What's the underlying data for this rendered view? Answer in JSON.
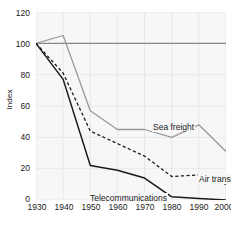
{
  "chart_data": {
    "type": "line",
    "title": "",
    "xlabel": "",
    "ylabel": "Index",
    "xlim": [
      1930,
      2000
    ],
    "ylim": [
      0,
      120
    ],
    "yticks": [
      0,
      20,
      40,
      60,
      80,
      100,
      120
    ],
    "xticks": [
      1930,
      1940,
      1950,
      1960,
      1970,
      1980,
      1990,
      2000
    ],
    "grid": true,
    "legend_position": "inline-annotations",
    "x": [
      1930,
      1940,
      1950,
      1960,
      1970,
      1980,
      1990,
      2000
    ],
    "series": [
      {
        "name": "Sea freight",
        "values": [
          100,
          105,
          57,
          45,
          45,
          40,
          48,
          31
        ],
        "color": "#999999",
        "style": "solid",
        "label": "Sea freight"
      },
      {
        "name": "Air transport",
        "values": [
          100,
          81,
          44,
          36,
          28,
          15,
          16,
          10
        ],
        "color": "#1a1a1a",
        "style": "dashed",
        "label": "Air transport"
      },
      {
        "name": "Telecommunications",
        "values": [
          100,
          77,
          22,
          19,
          14,
          2,
          1,
          0
        ],
        "color": "#1a1a1a",
        "style": "solid",
        "label": "Telecommunications"
      }
    ],
    "reference_line": {
      "name": "baseline-100",
      "value": 100,
      "color": "#888888"
    }
  },
  "axes": {
    "y_title": "Index",
    "y_tick_labels": [
      "120",
      "100",
      "80",
      "60",
      "40",
      "20",
      "0"
    ],
    "x_tick_labels": [
      "1930",
      "1940",
      "1950",
      "1960",
      "1970",
      "1980",
      "1990",
      "2000"
    ]
  },
  "annotations": {
    "sea_freight": "Sea freight",
    "air_transport": "Air transport",
    "telecommunications": "Telecommunications"
  },
  "colors": {
    "plot_background": "#f7f7f7",
    "grid": "#e4e4e4",
    "sea_freight": "#999999",
    "air_transport": "#1a1a1a",
    "telecommunications": "#1a1a1a",
    "reference": "#888888",
    "text": "#1a1a1a"
  }
}
